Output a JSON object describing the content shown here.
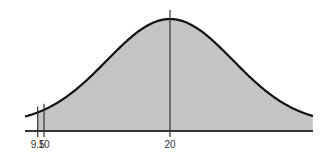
{
  "chart_data": {
    "type": "area",
    "title": "",
    "xlabel": "",
    "ylabel": "",
    "distribution": {
      "mean": 20,
      "sd": 5
    },
    "x_ticks": [
      9.5,
      10,
      20
    ],
    "tick_labels": [
      "9.5",
      "10",
      "20"
    ],
    "shaded_from": 9.5,
    "vertical_lines": [
      9.5,
      10,
      20
    ],
    "grid": false,
    "legend": null,
    "colors": {
      "fill": "#c4c4c4",
      "curve": "#111111",
      "axis": "#333333"
    }
  }
}
